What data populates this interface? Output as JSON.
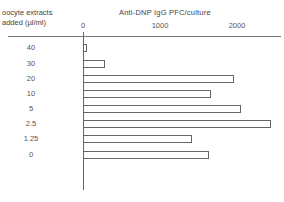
{
  "chart_data": {
    "type": "bar",
    "orientation": "horizontal",
    "title": "Anti-DNP IgG PFC/culture",
    "xlabel": "Anti-DNP IgG PFC/culture",
    "ylabel": "oocyte extracts added (µl/ml)",
    "ylabel_lines": [
      "oocyte extracts",
      "added (µl/ml)"
    ],
    "categories": [
      "40",
      "30",
      "20",
      "10",
      "5",
      "2.5",
      "1.25",
      "0"
    ],
    "values": [
      40,
      270,
      1950,
      1650,
      2040,
      2430,
      1400,
      1620
    ],
    "xticks": [
      "0",
      "1000",
      "2000"
    ],
    "xlim": [
      0,
      2500
    ],
    "axis_position": "top",
    "grid": false,
    "legend": null
  }
}
